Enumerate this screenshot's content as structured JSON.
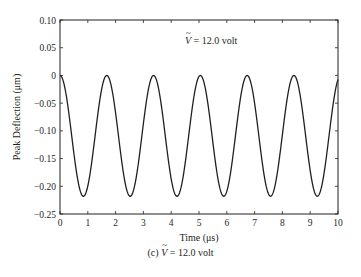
{
  "chart_data": {
    "type": "line",
    "title": "",
    "caption": "(c) Ṽ = 12.0 volt",
    "annotation": "Ṽ = 12.0 volt",
    "xlabel": "Time (μs)",
    "ylabel": "Peak Deflection (μm)",
    "xlim": [
      0,
      10
    ],
    "ylim": [
      -0.25,
      0.1
    ],
    "xticks": [
      "0",
      "1",
      "2",
      "3",
      "4",
      "5",
      "6",
      "7",
      "8",
      "9",
      "10"
    ],
    "yticks": [
      "0.10",
      "0.05",
      "0",
      "−0.05",
      "−0.10",
      "−0.15",
      "−0.20",
      "−0.25"
    ],
    "grid": false,
    "legend": null,
    "series": [
      {
        "name": "peak deflection",
        "color": "#231f20",
        "model": "y = -A/2 * (1 - cos(2*pi*t/T))",
        "amplitude_peak_to_peak": 0.218,
        "period_us": 1.683,
        "max": 0.0,
        "min": -0.218,
        "peaks_t": [
          0,
          1.68,
          3.37,
          5.05,
          6.73,
          8.42,
          10.1
        ],
        "troughs_t": [
          0.84,
          2.52,
          4.21,
          5.89,
          7.57,
          9.26
        ]
      }
    ]
  },
  "labels": {
    "annotation_prefix": "V",
    "annotation_suffix": " = 12.0 volt",
    "caption_prefix": "(c) ",
    "caption_v": "V",
    "caption_suffix": " = 12.0 volt",
    "xlabel": "Time (μs)",
    "ylabel": "Peak Deflection (μm)"
  }
}
